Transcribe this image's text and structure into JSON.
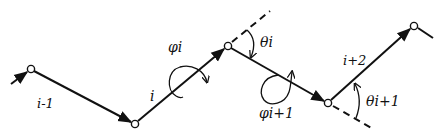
{
  "diagram": {
    "nodes": [
      {
        "id": "n0",
        "x": 31,
        "y": 69
      },
      {
        "id": "n1",
        "x": 135,
        "y": 124
      },
      {
        "id": "n2",
        "x": 228,
        "y": 46
      },
      {
        "id": "n3",
        "x": 328,
        "y": 103
      },
      {
        "id": "n4",
        "x": 414,
        "y": 26
      }
    ],
    "bonds": [
      {
        "label": "i-1",
        "from": "n0",
        "to": "n1"
      },
      {
        "label": "i",
        "from": "n1",
        "to": "n2"
      },
      {
        "label": "",
        "from": "n2",
        "to": "n3"
      },
      {
        "label": "i+2",
        "from": "n3",
        "to": "n4"
      }
    ],
    "labels": {
      "bond_i_minus_1": "i-1",
      "bond_i": "i",
      "bond_i_plus_2": "i+2",
      "phi_i": "φi",
      "phi_i_plus_1": "φi+1",
      "theta_i": "θi",
      "theta_i_plus_1": "θi+1"
    },
    "colors": {
      "line": "#111111",
      "background": "#ffffff"
    }
  }
}
